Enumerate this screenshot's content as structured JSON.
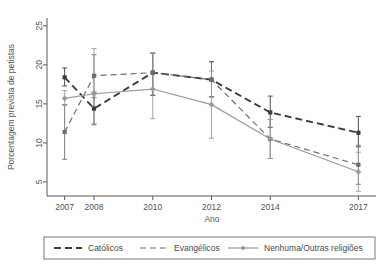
{
  "chart_data": {
    "type": "line",
    "title": "",
    "subtitle": "",
    "xlabel": "Ano",
    "ylabel": "Porcentagem prevista de petistas",
    "categories": [
      "2007",
      "2008",
      "2010",
      "2012",
      "2014",
      "2017"
    ],
    "x": [
      2007,
      2008,
      2010,
      2012,
      2014,
      2017
    ],
    "xlim": [
      2006.4,
      2017.6
    ],
    "ylim": [
      3.2,
      26.0
    ],
    "yticks": [
      5,
      10,
      15,
      20,
      25
    ],
    "ytick_labels": [
      "5",
      "10",
      "15",
      "20",
      "25"
    ],
    "xticks": [
      2007,
      2008,
      2010,
      2012,
      2014,
      2017
    ],
    "xtick_labels": [
      "2007",
      "2008",
      "2010",
      "2012",
      "2014",
      "2017"
    ],
    "grid": false,
    "legend_position": "bottom",
    "error_bars": "95% CI",
    "series": [
      {
        "name": "Católicos",
        "style": "dashed-thick",
        "color": "#3c3c3c",
        "marker": "square",
        "values": [
          18.4,
          14.4,
          19.0,
          18.1,
          13.9,
          11.3
        ],
        "ci_low": [
          17.3,
          12.4,
          16.1,
          15.9,
          12.0,
          9.5
        ],
        "ci_high": [
          19.6,
          16.5,
          21.5,
          20.4,
          16.0,
          13.4
        ]
      },
      {
        "name": "Evangélicos",
        "style": "dashed-thin",
        "color": "#6e6e6e",
        "marker": "square",
        "values": [
          11.4,
          18.6,
          19.0,
          18.1,
          10.5,
          7.2
        ],
        "ci_low": [
          7.9,
          15.8,
          16.1,
          15.9,
          8.0,
          4.7
        ],
        "ci_high": [
          14.9,
          21.3,
          21.5,
          20.4,
          13.0,
          9.7
        ]
      },
      {
        "name": "Nenhuma/Outras religiões",
        "style": "solid",
        "color": "#9a9a9a",
        "marker": "diamond",
        "values": [
          15.7,
          16.3,
          16.9,
          14.9,
          10.5,
          6.3
        ],
        "ci_low": [
          14.8,
          12.3,
          13.1,
          10.6,
          8.0,
          3.8
        ],
        "ci_high": [
          16.7,
          22.1,
          21.5,
          19.2,
          13.0,
          8.8
        ]
      }
    ]
  },
  "legend": {
    "items": [
      {
        "label": "Católicos",
        "swatch": "dashed-thick-swatch"
      },
      {
        "label": "Evangélicos",
        "swatch": "dashed-thin-swatch"
      },
      {
        "label": "Nenhuma/Outras religiões",
        "swatch": "solid-diamond-swatch"
      }
    ]
  },
  "colors": {
    "catolicos": "#3c3c3c",
    "evangelicos": "#6e6e6e",
    "nenhuma": "#9a9a9a",
    "axis": "#595959",
    "legend_border": "#7a7a7a",
    "background": "#ffffff"
  }
}
